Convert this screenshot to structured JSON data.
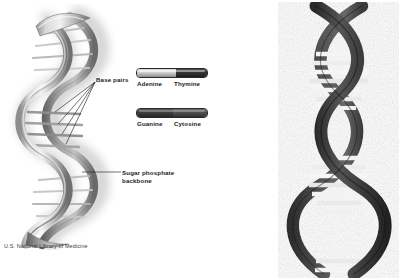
{
  "figure": {
    "background_color": "#ffffff"
  },
  "left_diagram": {
    "name": "dna-double-helix-ribbon",
    "callouts": {
      "base_pairs_label": "Base pairs",
      "sugar_phosphate_label": "Sugar phosphate backbone"
    },
    "colors": {
      "ribbon_light": "#e3e3e3",
      "ribbon_mid": "#9a9a9a",
      "ribbon_dark": "#5a5a5a",
      "shadow": "#c9c9c9",
      "rung": "#6a6a6a"
    }
  },
  "legend": {
    "name": "base-pair-legend",
    "pairs": [
      {
        "id": "adenine-thymine",
        "left_base": "Adenine",
        "right_base": "Thymine",
        "left_color": "#cfcfcf",
        "right_color": "#2b2b2b"
      },
      {
        "id": "guanine-cytosine",
        "left_base": "Guanine",
        "right_base": "Cytosine",
        "left_color": "#3d3d3d",
        "right_color": "#555555"
      }
    ]
  },
  "attribution": {
    "text": "U.S. National Library of Medicine"
  },
  "right_diagram": {
    "name": "dna-double-helix-photographic",
    "colors": {
      "strand_dark": "#3b3b3b",
      "strand_mid": "#6d6d6d",
      "rung_light": "#f2f2f2",
      "rung_shadow": "#888888"
    }
  }
}
